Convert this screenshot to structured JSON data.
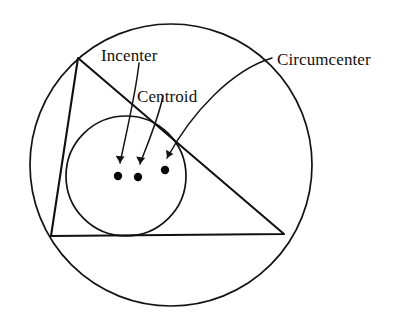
{
  "figure": {
    "background_color": "#ffffff",
    "ink_color": "#111111",
    "width": 396,
    "height": 321
  },
  "labels": [
    {
      "id": "incenter",
      "text": "Incenter",
      "x": 101,
      "y": 47,
      "points_to": "incenter-dot"
    },
    {
      "id": "centroid",
      "text": "Centroid",
      "x": 137,
      "y": 88,
      "points_to": "centroid-dot"
    },
    {
      "id": "circumcenter",
      "text": "Circumcenter",
      "x": 277,
      "y": 51,
      "points_to": "circumcenter-dot"
    }
  ],
  "centers": [
    {
      "id": "incenter-dot",
      "name": "Incenter",
      "x": 118,
      "y": 176,
      "r": 4.2
    },
    {
      "id": "centroid-dot",
      "name": "Centroid",
      "x": 138,
      "y": 177,
      "r": 4.2
    },
    {
      "id": "circumcenter-dot",
      "name": "Circumcenter",
      "x": 165,
      "y": 170,
      "r": 4.2
    }
  ],
  "circumcircle": {
    "name": "circumscribed circle",
    "cx": 171,
    "cy": 165,
    "r": 141
  },
  "incircle": {
    "name": "inscribed circle",
    "cx": 126,
    "cy": 176,
    "r": 60
  },
  "triangle": {
    "name": "triangle",
    "vertices": [
      {
        "label": "top-left",
        "x": 78,
        "y": 58
      },
      {
        "label": "bottom-right",
        "x": 284,
        "y": 234
      },
      {
        "label": "bottom-left",
        "x": 51,
        "y": 236
      }
    ]
  },
  "leaders": [
    {
      "id": "incenter-leader",
      "path": "M 139 63 C 136 92 127 130 120 163",
      "arrow": "M 120 163 L 115.6 155.8 L 124.6 156.6 Z"
    },
    {
      "id": "centroid-leader",
      "path": "M 163 96 C 158 120 147 145 140 164",
      "arrow": "M 140 164 L 136.2 156.6 L 145.1 157.9 Z"
    },
    {
      "id": "circumcenter-leader",
      "path": "M 272 58 C 232 70 192 112 167 158",
      "arrow": "M 167 158 L 166.0 149.7 L 173.4 154.0 Z"
    }
  ]
}
